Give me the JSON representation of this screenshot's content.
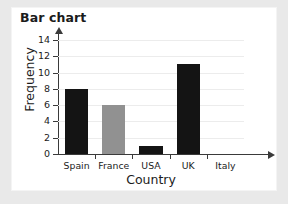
{
  "figure": {
    "background_color": "#e9e9e9",
    "panel_color": "#ffffff",
    "title": "Bar chart"
  },
  "chart_data": {
    "type": "bar",
    "title": "Bar chart",
    "xlabel": "Country",
    "ylabel": "Frequency",
    "categories": [
      "Spain",
      "France",
      "USA",
      "UK",
      "Italy"
    ],
    "values": [
      8,
      6,
      1,
      11,
      0
    ],
    "bar_colors": [
      "#141414",
      "#919191",
      "#141414",
      "#141414",
      "#141414"
    ],
    "ylim": [
      0,
      14
    ],
    "ytick_labels": [
      "0",
      "2",
      "4",
      "6",
      "8",
      "10",
      "12",
      "14"
    ],
    "ytick_values": [
      0,
      2,
      4,
      6,
      8,
      10,
      12,
      14
    ],
    "grid": "horizontal",
    "grid_color": "#ececec",
    "legend": "none",
    "axis_color": "#3a3a3a",
    "axis_arrows": true,
    "series": [
      {
        "name": "Frequency",
        "values": [
          8,
          6,
          1,
          11,
          0
        ]
      }
    ]
  }
}
